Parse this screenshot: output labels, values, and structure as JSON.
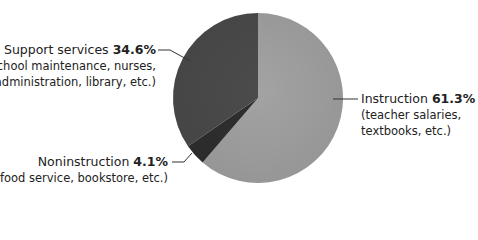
{
  "chart_data": {
    "type": "pie",
    "title": "",
    "categories": [
      "Instruction",
      "Noninstruction",
      "Support services"
    ],
    "values": [
      61.3,
      4.1,
      34.6
    ],
    "units": "%",
    "colors": [
      "#a3a3a3",
      "#2f2f2f",
      "#4b4b4b"
    ],
    "descriptions": [
      "(teacher salaries, textbooks, etc.)",
      "(food service, bookstore, etc.)",
      "(school maintenance, nurses, administration, library, etc.)"
    ],
    "legend": "none (leader-line labels)"
  },
  "labels": {
    "support": {
      "name": "Support services",
      "pct": "34.6%",
      "desc1": "(school maintenance, nurses,",
      "desc2": "administration, library, etc.)"
    },
    "noninstruction": {
      "name": "Noninstruction",
      "pct": "4.1%",
      "desc1": "(food service, bookstore, etc.)"
    },
    "instruction": {
      "name": "Instruction",
      "pct": "61.3%",
      "desc1": "(teacher salaries,",
      "desc2": "textbooks, etc.)"
    }
  }
}
